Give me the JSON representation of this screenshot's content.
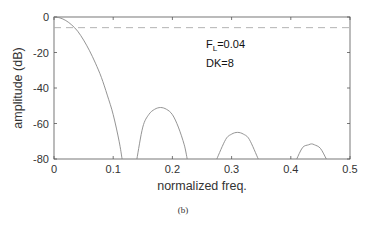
{
  "chart_data": {
    "type": "line",
    "title": "",
    "xlabel": "normalized freq.",
    "ylabel": "amplitude (dB)",
    "xlim": [
      0,
      0.5
    ],
    "ylim": [
      -80,
      0
    ],
    "xticks": [
      "0",
      "0.1",
      "0.2",
      "0.3",
      "0.4",
      "0.5"
    ],
    "yticks": [
      "0",
      "-20",
      "-40",
      "-60",
      "-80"
    ],
    "grid": false,
    "annotations": [
      "F_L=0.04",
      "DK=8"
    ],
    "reference_line": {
      "y": -6,
      "style": "dashed",
      "color": "#aaaaaa"
    },
    "series": [
      {
        "name": "response",
        "color": "#888888",
        "x": [
          0,
          0.01,
          0.02,
          0.03,
          0.04,
          0.05,
          0.06,
          0.07,
          0.08,
          0.09,
          0.1,
          0.11,
          0.115,
          0.14,
          0.15,
          0.16,
          0.17,
          0.18,
          0.19,
          0.2,
          0.21,
          0.22,
          0.225,
          0.275,
          0.29,
          0.3,
          0.31,
          0.32,
          0.33,
          0.345,
          0.41,
          0.42,
          0.43,
          0.435,
          0.44,
          0.45,
          0.46
        ],
        "y": [
          0,
          -0.5,
          -2,
          -4.5,
          -8,
          -13,
          -19,
          -26,
          -34,
          -44,
          -55,
          -70,
          -80,
          -80,
          -62,
          -55,
          -52,
          -51,
          -52,
          -55,
          -62,
          -72,
          -80,
          -80,
          -69,
          -66,
          -65,
          -66,
          -69,
          -80,
          -80,
          -73.5,
          -72,
          -71.5,
          -72,
          -74,
          -80
        ]
      }
    ]
  },
  "caption": "(b)",
  "labels": {
    "ann_f": "F",
    "ann_f_sub": "L",
    "ann_f_val": "=0.04",
    "ann_dk": "DK=8"
  }
}
